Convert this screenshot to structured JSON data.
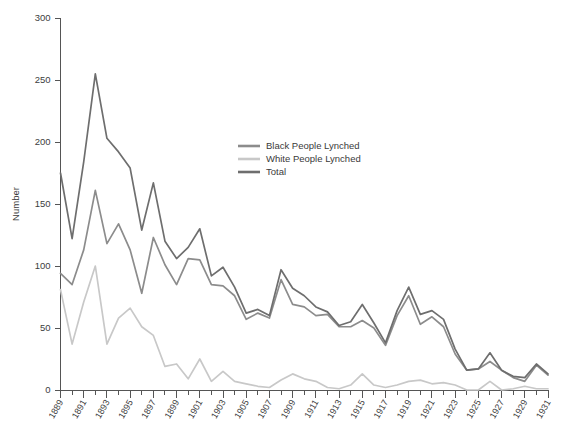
{
  "chart_data": {
    "type": "line",
    "title": "",
    "subtitle": "",
    "xlabel": "",
    "ylabel": "Number",
    "ylim": [
      0,
      300
    ],
    "ytick_step": 50,
    "yticks": [
      0,
      50,
      100,
      150,
      200,
      250,
      300
    ],
    "grid": false,
    "legend_position": "upper-center-right",
    "x": [
      1889,
      1890,
      1891,
      1892,
      1893,
      1894,
      1895,
      1896,
      1897,
      1898,
      1899,
      1900,
      1901,
      1902,
      1903,
      1904,
      1905,
      1906,
      1907,
      1908,
      1909,
      1910,
      1911,
      1912,
      1913,
      1914,
      1915,
      1916,
      1917,
      1918,
      1919,
      1920,
      1921,
      1922,
      1923,
      1924,
      1925,
      1926,
      1927,
      1928,
      1929,
      1930,
      1931
    ],
    "xtick_labels": [
      "1889",
      "1891",
      "1893",
      "1895",
      "1897",
      "1899",
      "1901",
      "1903",
      "1905",
      "1907",
      "1909",
      "1911",
      "1913",
      "1915",
      "1917",
      "1919",
      "1921",
      "1923",
      "1925",
      "1927",
      "1929",
      "1931"
    ],
    "series": [
      {
        "name": "Black People Lynched",
        "color": "#8c8c8c",
        "values": [
          94,
          85,
          113,
          161,
          118,
          134,
          113,
          78,
          123,
          101,
          85,
          106,
          105,
          85,
          84,
          76,
          57,
          62,
          58,
          89,
          69,
          67,
          60,
          61,
          51,
          51,
          56,
          50,
          36,
          60,
          76,
          53,
          59,
          51,
          29,
          16,
          17,
          23,
          16,
          10,
          7,
          20,
          12
        ]
      },
      {
        "name": "White People Lynched",
        "color": "#c8c8c8",
        "values": [
          81,
          37,
          71,
          100,
          37,
          58,
          66,
          51,
          44,
          19,
          21,
          9,
          25,
          7,
          15,
          7,
          5,
          3,
          2,
          8,
          13,
          9,
          7,
          2,
          1,
          4,
          13,
          4,
          2,
          4,
          7,
          8,
          5,
          6,
          4,
          0,
          0,
          7,
          0,
          1,
          3,
          1,
          1
        ]
      },
      {
        "name": "Total",
        "color": "#6e6e6e",
        "values": [
          175,
          122,
          184,
          255,
          203,
          192,
          179,
          129,
          167,
          120,
          106,
          115,
          130,
          92,
          99,
          83,
          62,
          65,
          60,
          97,
          82,
          76,
          67,
          63,
          52,
          55,
          69,
          54,
          38,
          64,
          83,
          61,
          64,
          57,
          33,
          16,
          17,
          30,
          16,
          11,
          10,
          21,
          13
        ]
      }
    ]
  },
  "legend": {
    "items": [
      {
        "label": "Black People Lynched"
      },
      {
        "label": "White People Lynched"
      },
      {
        "label": "Total"
      }
    ]
  },
  "axes": {
    "y_title": "Number"
  }
}
